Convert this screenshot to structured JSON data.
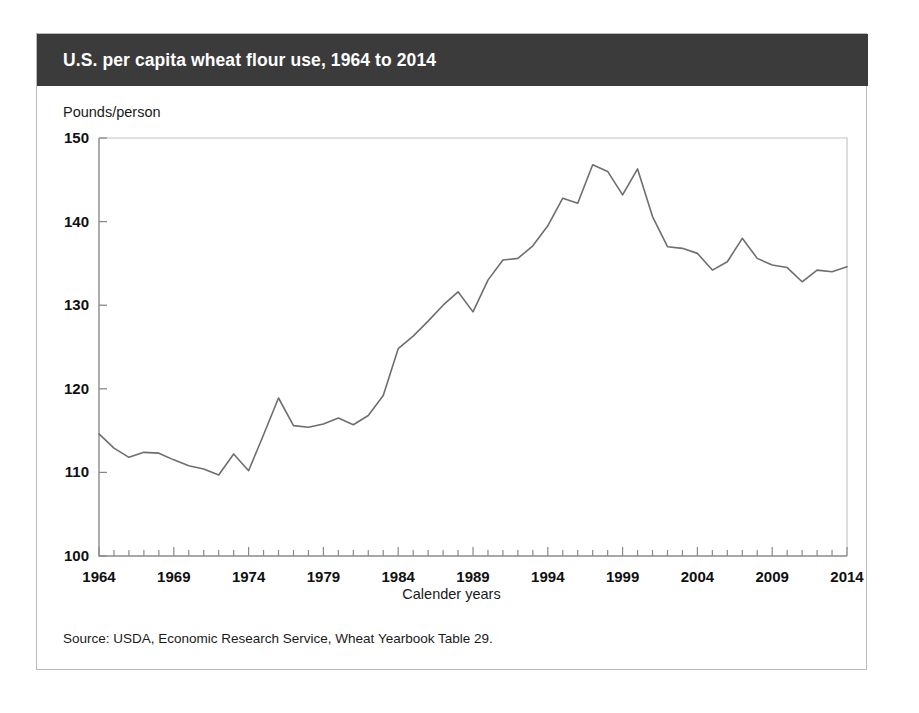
{
  "card": {
    "title": "U.S. per capita wheat flour use, 1964 to 2014",
    "source": "Source: USDA, Economic Research Service, Wheat Yearbook Table 29.",
    "header_background": "#3b3b3b",
    "header_text_color": "#ffffff",
    "border_color": "#b9b9b9",
    "line_color": "#6e6e6e",
    "axis_color": "#8a8a8a"
  },
  "chart_data": {
    "type": "line",
    "title": "U.S. per capita wheat flour use, 1964 to 2014",
    "xlabel": "Calender years",
    "ylabel": "Pounds/person",
    "xlim": [
      1964,
      2014
    ],
    "ylim": [
      100,
      150
    ],
    "yticks": [
      100,
      110,
      120,
      130,
      140,
      150
    ],
    "xticks": [
      1964,
      1969,
      1974,
      1979,
      1984,
      1989,
      1994,
      1999,
      2004,
      2009,
      2014
    ],
    "xtick_minor_step": 1,
    "grid": false,
    "legend": false,
    "series": [
      {
        "name": "Wheat flour use per capita",
        "x": [
          1964,
          1965,
          1966,
          1967,
          1968,
          1969,
          1970,
          1971,
          1972,
          1973,
          1974,
          1975,
          1976,
          1977,
          1978,
          1979,
          1980,
          1981,
          1982,
          1983,
          1984,
          1985,
          1986,
          1987,
          1988,
          1989,
          1990,
          1991,
          1992,
          1993,
          1994,
          1995,
          1996,
          1997,
          1998,
          1999,
          2000,
          2001,
          2002,
          2003,
          2004,
          2005,
          2006,
          2007,
          2008,
          2009,
          2010,
          2011,
          2012,
          2013,
          2014
        ],
        "values": [
          114.6,
          112.9,
          111.8,
          112.4,
          112.3,
          111.5,
          110.8,
          110.4,
          109.7,
          112.2,
          110.2,
          114.5,
          118.9,
          115.6,
          115.4,
          115.8,
          116.5,
          115.7,
          116.8,
          119.2,
          124.8,
          126.3,
          128.1,
          130.0,
          131.6,
          129.2,
          133.0,
          135.4,
          135.6,
          137.1,
          139.5,
          142.8,
          142.2,
          146.8,
          146.0,
          143.2,
          146.3,
          140.6,
          137.0,
          136.8,
          136.2,
          134.2,
          135.2,
          138.0,
          135.6,
          134.8,
          134.5,
          132.8,
          134.2,
          134.0,
          134.6
        ]
      }
    ]
  }
}
